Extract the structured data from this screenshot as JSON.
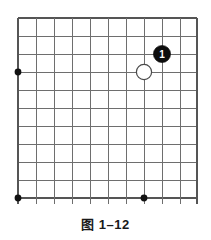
{
  "figure": {
    "caption": "图 1–12",
    "caption_label": "图",
    "caption_number": "1–12"
  },
  "board": {
    "type": "go-board-corner",
    "columns": 11,
    "rows": 11,
    "cell_size": 18,
    "origin_x": 18,
    "origin_y": 18,
    "line_color": "#6e6e6e",
    "edge_color": "#555555",
    "background_color": "#ffffff",
    "star_points": [
      {
        "col": 1,
        "row": 4,
        "name": "star-point-left"
      },
      {
        "col": 1,
        "row": 11,
        "name": "star-point-bottom-left"
      },
      {
        "col": 8,
        "row": 11,
        "name": "star-point-bottom-center"
      }
    ],
    "stones": [
      {
        "name": "white-stone",
        "color": "white",
        "col": 8,
        "row": 4,
        "label": "",
        "fill": "#ffffff",
        "stroke": "#4a4a4a"
      },
      {
        "name": "black-stone-move-1",
        "color": "black",
        "col": 9,
        "row": 3,
        "label": "1",
        "fill": "#0d0d0d",
        "stroke": "#0d0d0d",
        "label_color": "#ffffff"
      }
    ]
  }
}
